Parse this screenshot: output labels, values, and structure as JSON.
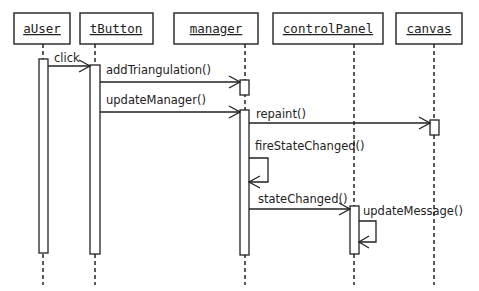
{
  "diagram": {
    "type": "uml-sequence-diagram",
    "objects": [
      {
        "id": "aUser",
        "label": "aUser"
      },
      {
        "id": "tButton",
        "label": "tButton"
      },
      {
        "id": "manager",
        "label": "manager"
      },
      {
        "id": "controlPanel",
        "label": "controlPanel"
      },
      {
        "id": "canvas",
        "label": "canvas"
      }
    ],
    "messages": [
      {
        "from": "aUser",
        "to": "tButton",
        "label": "click"
      },
      {
        "from": "tButton",
        "to": "manager",
        "label": "addTriangulation()"
      },
      {
        "from": "tButton",
        "to": "manager",
        "label": "updateManager()"
      },
      {
        "from": "manager",
        "to": "canvas",
        "label": "repaint()"
      },
      {
        "from": "manager",
        "to": "manager",
        "label": "fireStateChanged()"
      },
      {
        "from": "manager",
        "to": "controlPanel",
        "label": "stateChanged()"
      },
      {
        "from": "controlPanel",
        "to": "controlPanel",
        "label": "updateMessage()"
      }
    ]
  }
}
